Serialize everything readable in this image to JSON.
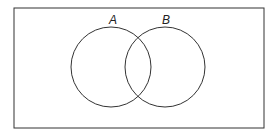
{
  "diagram": {
    "type": "venn",
    "universe": {
      "x": 14,
      "y": 8,
      "width": 250,
      "height": 120
    },
    "sets": [
      {
        "label": "A",
        "cx": 111,
        "cy": 67,
        "r": 40,
        "label_x": 113,
        "label_y": 24
      },
      {
        "label": "B",
        "cx": 165,
        "cy": 67,
        "r": 40,
        "label_x": 166,
        "label_y": 24
      }
    ],
    "stroke_color": "#333333"
  }
}
